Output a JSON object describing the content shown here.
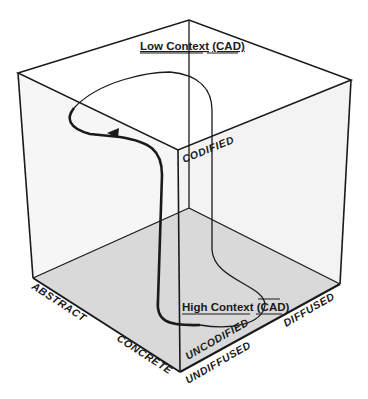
{
  "diagram": {
    "type": "3d-cube-information-space",
    "top_label": {
      "prefix": "Low Context",
      "suffix": "(CAD)"
    },
    "bottom_label": {
      "prefix": "High Context",
      "open": "(",
      "letters": [
        "C",
        "A",
        "D"
      ],
      "close": ")",
      "overbar": true
    },
    "axes": {
      "abstraction": {
        "high": "ABSTRACT",
        "low": "CONCRETE"
      },
      "codification": {
        "high": "CODIFIED",
        "low": "UNCODIFIED"
      },
      "diffusion": {
        "high": "DIFFUSED",
        "low": "UNDIFFUSED"
      }
    },
    "colors": {
      "line": "#1a1a1a",
      "floor": "#d9d9d9",
      "walls": "#f4f4f4",
      "background": "#ffffff"
    }
  }
}
